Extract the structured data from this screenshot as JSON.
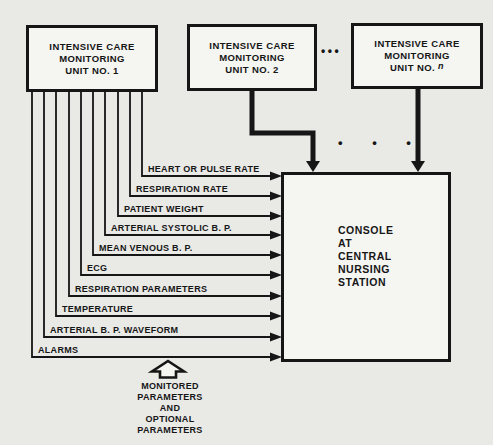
{
  "diagram": {
    "units": [
      {
        "lines": [
          "INTENSIVE CARE",
          "MONITORING",
          "UNIT NO. 1"
        ]
      },
      {
        "lines": [
          "INTENSIVE CARE",
          "MONITORING",
          "UNIT NO. 2"
        ]
      },
      {
        "lines": [
          "INTENSIVE CARE",
          "MONITORING"
        ],
        "line3_prefix": "UNIT NO.",
        "line3_var": "n"
      }
    ],
    "console": {
      "lines": [
        "CONSOLE",
        "AT",
        "CENTRAL",
        "NURSING",
        "STATION"
      ]
    },
    "params": [
      {
        "label": "HEART OR PULSE RATE"
      },
      {
        "label": "RESPIRATION RATE"
      },
      {
        "label": "PATIENT WEIGHT"
      },
      {
        "label": "ARTERIAL SYSTOLIC B. P."
      },
      {
        "label": "MEAN VENOUS B. P."
      },
      {
        "label": "ECG"
      },
      {
        "label": "RESPIRATION PARAMETERS"
      },
      {
        "label": "TEMPERATURE"
      },
      {
        "label": "ARTERIAL B. P. WAVEFORM"
      },
      {
        "label": "ALARMS"
      }
    ],
    "caption": "MONITORED\nPARAMETERS\nAND\nOPTIONAL\nPARAMETERS",
    "ellipsis_between_units": "•••",
    "ellipsis_above_console": "• • •",
    "colors": {
      "ink": "#161616",
      "paper": "#e9e9e6",
      "box_fill": "#f5f5f2"
    }
  }
}
